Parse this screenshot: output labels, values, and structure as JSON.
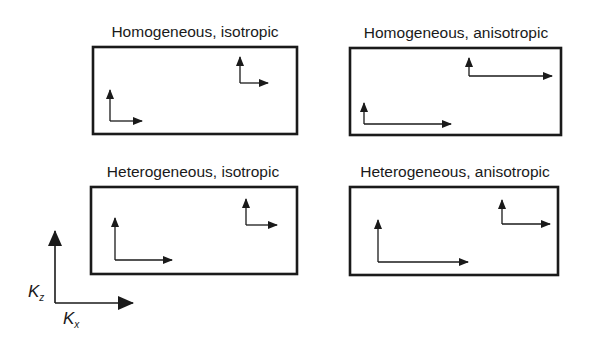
{
  "diagram": {
    "panels": [
      {
        "id": "homogeneous-isotropic",
        "title": "Homogeneous, isotropic",
        "box": {
          "x": 93,
          "y": 47,
          "w": 204,
          "h": 87
        },
        "vector_pairs": [
          {
            "origin": [
              110,
              121
            ],
            "kz_len": 31,
            "kx_len": 32
          },
          {
            "origin": [
              240,
              83
            ],
            "kz_len": 26,
            "kx_len": 28
          }
        ]
      },
      {
        "id": "homogeneous-anisotropic",
        "title": "Homogeneous, anisotropic",
        "box": {
          "x": 350,
          "y": 48,
          "w": 211,
          "h": 87
        },
        "vector_pairs": [
          {
            "origin": [
              364,
              124
            ],
            "kz_len": 21,
            "kx_len": 87
          },
          {
            "origin": [
              469,
              76
            ],
            "kz_len": 18,
            "kx_len": 83
          }
        ]
      },
      {
        "id": "heterogeneous-isotropic",
        "title": "Heterogeneous, isotropic",
        "box": {
          "x": 91,
          "y": 187,
          "w": 206,
          "h": 87
        },
        "vector_pairs": [
          {
            "origin": [
              115,
              260
            ],
            "kz_len": 42,
            "kx_len": 57
          },
          {
            "origin": [
              246,
              225
            ],
            "kz_len": 26,
            "kx_len": 31
          }
        ]
      },
      {
        "id": "heterogeneous-anisotropic",
        "title": "Heterogeneous, anisotropic",
        "box": {
          "x": 350,
          "y": 187,
          "w": 208,
          "h": 88
        },
        "vector_pairs": [
          {
            "origin": [
              378,
              262
            ],
            "kz_len": 42,
            "kx_len": 90
          },
          {
            "origin": [
              502,
              224
            ],
            "kz_len": 24,
            "kx_len": 48
          }
        ]
      }
    ],
    "legend_axes": {
      "origin": [
        55,
        303
      ],
      "kz_len": 72,
      "kx_len": 78,
      "kz_label": "K",
      "kz_sub": "z",
      "kx_label": "K",
      "kx_sub": "x"
    },
    "colors": {
      "stroke": "#1a1a1a",
      "background": "#ffffff"
    }
  }
}
